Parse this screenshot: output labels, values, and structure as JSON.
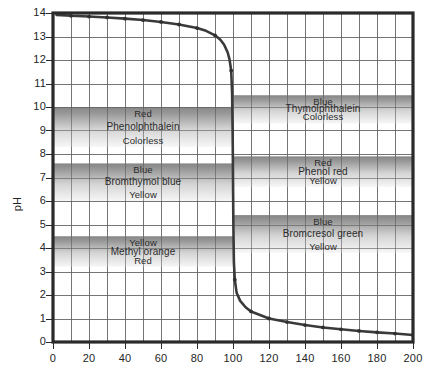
{
  "chart_data": {
    "type": "line",
    "title": "",
    "xlabel": "",
    "ylabel": "pH",
    "xlim": [
      0,
      200
    ],
    "ylim": [
      0,
      14
    ],
    "xticks": [
      0,
      20,
      40,
      60,
      80,
      100,
      120,
      140,
      160,
      180,
      200
    ],
    "yticks": [
      0,
      1,
      2,
      3,
      4,
      5,
      6,
      7,
      8,
      9,
      10,
      11,
      12,
      13,
      14
    ],
    "grid": true,
    "grid_x_step": 10,
    "grid_y_step": 1,
    "legend": "none",
    "series": [
      {
        "name": "Titration curve",
        "marker": "dot",
        "color": "#3a3a3a",
        "points": [
          [
            2,
            13.92
          ],
          [
            10,
            13.88
          ],
          [
            20,
            13.85
          ],
          [
            30,
            13.81
          ],
          [
            40,
            13.76
          ],
          [
            50,
            13.7
          ],
          [
            60,
            13.62
          ],
          [
            70,
            13.51
          ],
          [
            80,
            13.36
          ],
          [
            85,
            13.24
          ],
          [
            90,
            13.05
          ],
          [
            93,
            12.86
          ],
          [
            95,
            12.66
          ],
          [
            97,
            12.33
          ],
          [
            98,
            12.05
          ],
          [
            99,
            11.55
          ],
          [
            99.5,
            10.6
          ],
          [
            99.8,
            9.0
          ],
          [
            100,
            7.0
          ],
          [
            100.2,
            5.0
          ],
          [
            100.5,
            3.4
          ],
          [
            101,
            2.65
          ],
          [
            102,
            2.1
          ],
          [
            104,
            1.75
          ],
          [
            107,
            1.48
          ],
          [
            110,
            1.3
          ],
          [
            120,
            1.0
          ],
          [
            130,
            0.85
          ],
          [
            140,
            0.72
          ],
          [
            150,
            0.62
          ],
          [
            160,
            0.54
          ],
          [
            170,
            0.47
          ],
          [
            180,
            0.41
          ],
          [
            190,
            0.36
          ],
          [
            200,
            0.3
          ]
        ]
      }
    ],
    "indicator_bands": [
      {
        "id": "phenolphthalein-left",
        "name": "Phenolphthalein",
        "side": "left",
        "ph_top": 10.0,
        "ph_bottom": 8.3,
        "label_top": "Red",
        "label_bottom": "Colorless"
      },
      {
        "id": "bromthymol-blue-left",
        "name": "Bromthymol blue",
        "side": "left",
        "ph_top": 7.6,
        "ph_bottom": 6.0,
        "label_top": "Blue",
        "label_bottom": "Yellow"
      },
      {
        "id": "methyl-orange-left",
        "name": "Methyl orange",
        "side": "left",
        "ph_top": 4.5,
        "ph_bottom": 3.2,
        "label_top": "Yellow",
        "label_bottom": "Red"
      },
      {
        "id": "thymolphthalein-right",
        "name": "Thymolphthalein",
        "side": "right",
        "ph_top": 10.5,
        "ph_bottom": 9.3,
        "label_top": "Blue",
        "label_bottom": "Colorless"
      },
      {
        "id": "phenol-red-right",
        "name": "Phenol red",
        "side": "right",
        "ph_top": 7.9,
        "ph_bottom": 6.6,
        "label_top": "Red",
        "label_bottom": "Yellow"
      },
      {
        "id": "bromcresol-green-right",
        "name": "Bromcresol green",
        "side": "right",
        "ph_top": 5.4,
        "ph_bottom": 3.8,
        "label_top": "Blue",
        "label_bottom": "Yellow"
      }
    ],
    "colors": {
      "curve": "#3a3a3a",
      "frame": "#2a2a2a",
      "gridline": "#6d6d6d",
      "band_dark": "#8d8d8d",
      "band_light": "#f2f2f2",
      "background": "#ffffff",
      "text": "#252525"
    }
  },
  "axes": {
    "y_label": "pH",
    "y_ticks": [
      "0",
      "1",
      "2",
      "3",
      "4",
      "5",
      "6",
      "7",
      "8",
      "9",
      "10",
      "11",
      "12",
      "13",
      "14"
    ],
    "x_ticks": [
      "0",
      "20",
      "40",
      "60",
      "80",
      "100",
      "120",
      "140",
      "160",
      "180",
      "200"
    ]
  },
  "bands": {
    "phenolphthalein": {
      "top": "Red",
      "name": "Phenolphthalein",
      "bottom": "Colorless"
    },
    "bromthymol_blue": {
      "top": "Blue",
      "name": "Bromthymol blue",
      "bottom": "Yellow"
    },
    "methyl_orange": {
      "top": "Yellow",
      "name": "Methyl orange",
      "bottom": "Red"
    },
    "thymolphthalein": {
      "top": "Blue",
      "name": "Thymolphthalein",
      "bottom": "Colorless"
    },
    "phenol_red": {
      "top": "Red",
      "name": "Phenol red",
      "bottom": "Yellow"
    },
    "bromcresol_green": {
      "top": "Blue",
      "name": "Bromcresol green",
      "bottom": "Yellow"
    }
  }
}
